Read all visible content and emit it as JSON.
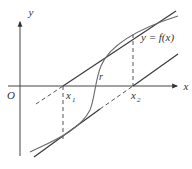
{
  "diagram": {
    "axes": {
      "x_label": "x",
      "y_label": "y",
      "origin_label": "O"
    },
    "curve": {
      "label": "y = f(x)",
      "root_label": "r"
    },
    "points": [
      {
        "label": "x",
        "subscript": "1"
      },
      {
        "label": "x",
        "subscript": "2"
      }
    ],
    "colors": {
      "axis": "#444444",
      "tangent": "#3a3a3a",
      "curve": "#6a6a6a",
      "background": "#ffffff"
    }
  }
}
